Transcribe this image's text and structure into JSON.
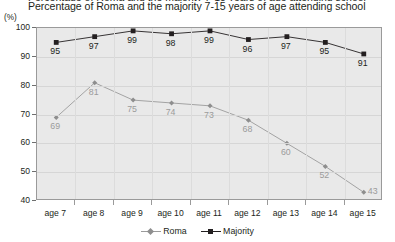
{
  "top_clipped_text": "Percentage of Roma and the majority 7-15 years of age attending school",
  "chart_data": {
    "type": "line",
    "title": "Percentage of Roma and the majority 7-15 years of age attending school",
    "xlabel": "",
    "ylabel": "(%)",
    "ylim": [
      40,
      100
    ],
    "yticks": [
      40,
      50,
      60,
      70,
      80,
      90,
      100
    ],
    "grid": true,
    "legend_position": "bottom",
    "categories": [
      "age 7",
      "age 8",
      "age 9",
      "age 10",
      "age 11",
      "age 12",
      "age 13",
      "age 14",
      "age 15"
    ],
    "series": [
      {
        "name": "Roma",
        "color": "#9b9b9b",
        "marker": "diamond",
        "values": [
          69,
          81,
          75,
          74,
          73,
          68,
          60,
          52,
          43
        ]
      },
      {
        "name": "Majority",
        "color": "#231f20",
        "marker": "square",
        "values": [
          95,
          97,
          99,
          98,
          99,
          96,
          97,
          95,
          91
        ]
      }
    ]
  }
}
